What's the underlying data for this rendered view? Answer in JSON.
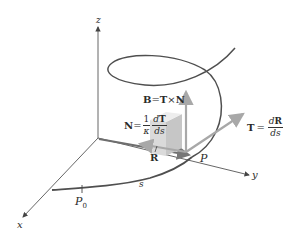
{
  "figure": {
    "axes": {
      "x_label": "x",
      "y_label": "y",
      "z_label": "z"
    },
    "points": {
      "p0_label": "P",
      "p0_subscript": "0",
      "p_label": "P"
    },
    "arc_length_label": "s",
    "vectors": {
      "R": {
        "label": "R"
      },
      "B": {
        "lhs": "B",
        "eq": "=",
        "a": "T",
        "op": "×",
        "b": "N"
      },
      "N": {
        "lhs": "N",
        "eq": "=",
        "coef_num": "1",
        "coef_den": "κ",
        "frac_num_d": "d",
        "frac_num_v": "T",
        "frac_den": "ds"
      },
      "T": {
        "lhs": "T",
        "eq": "=",
        "frac_num_d": "d",
        "frac_num_v": "R",
        "frac_den": "ds"
      }
    },
    "colors": {
      "curve": "#555555",
      "axis": "#555555",
      "vector_arrow": "#9a9a9a",
      "cube_front": "#d9d9d9",
      "cube_top": "#ececec",
      "cube_side": "#c4c4c4",
      "text": "#2a2a2a"
    }
  }
}
